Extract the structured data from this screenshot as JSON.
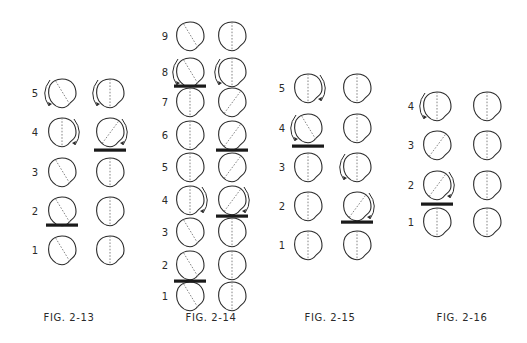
{
  "colors": {
    "ink": "#2a2a2a",
    "dash": "#777777",
    "bar": "#1a1a1a",
    "background": "#ffffff"
  },
  "figures": [
    {
      "caption": "FIG. 2-13",
      "caption_x": 69,
      "caption_y": 318,
      "label_x": 35,
      "columns_x": [
        62,
        110
      ],
      "rows": [
        {
          "label": "5",
          "y": 93,
          "cells": [
            {
              "line": "diag-left",
              "arrow": "left-ccw"
            },
            {
              "line": "vertical",
              "arrow": "left-ccw"
            }
          ]
        },
        {
          "label": "4",
          "y": 132,
          "cells": [
            {
              "line": "vertical",
              "arrow": "right-cw"
            },
            {
              "line": "diag-right",
              "arrow": "right-cw"
            }
          ]
        },
        {
          "label": "3",
          "y": 172,
          "cells": [
            {
              "line": "diag-left",
              "arrow": null
            },
            {
              "line": "vertical",
              "arrow": null
            }
          ]
        },
        {
          "label": "2",
          "y": 211,
          "cells": [
            {
              "line": "diag-left",
              "arrow": null
            },
            {
              "line": "vertical",
              "arrow": null
            }
          ]
        },
        {
          "label": "1",
          "y": 250,
          "cells": [
            {
              "line": "diag-left",
              "arrow": null
            },
            {
              "line": "vertical",
              "arrow": null
            }
          ]
        }
      ],
      "bars": [
        {
          "col": 1,
          "y": 150
        },
        {
          "col": 0,
          "y": 225
        }
      ]
    },
    {
      "caption": "FIG. 2-14",
      "caption_x": 211,
      "caption_y": 318,
      "label_x": 165,
      "columns_x": [
        190,
        232
      ],
      "rows": [
        {
          "label": "9",
          "y": 36,
          "cells": [
            {
              "line": "diag-left",
              "arrow": null
            },
            {
              "line": "vertical",
              "arrow": null
            }
          ]
        },
        {
          "label": "8",
          "y": 72,
          "cells": [
            {
              "line": "diag-left",
              "arrow": "left-ccw"
            },
            {
              "line": "vertical",
              "arrow": "left-ccw"
            }
          ]
        },
        {
          "label": "7",
          "y": 102,
          "cells": [
            {
              "line": "vertical",
              "arrow": null
            },
            {
              "line": "diag-right",
              "arrow": null
            }
          ]
        },
        {
          "label": "6",
          "y": 135,
          "cells": [
            {
              "line": "vertical",
              "arrow": null
            },
            {
              "line": "diag-right",
              "arrow": null
            }
          ]
        },
        {
          "label": "5",
          "y": 167,
          "cells": [
            {
              "line": "vertical",
              "arrow": null
            },
            {
              "line": "diag-right",
              "arrow": null
            }
          ]
        },
        {
          "label": "4",
          "y": 200,
          "cells": [
            {
              "line": "vertical",
              "arrow": "right-cw"
            },
            {
              "line": "diag-right",
              "arrow": "right-cw"
            }
          ]
        },
        {
          "label": "3",
          "y": 232,
          "cells": [
            {
              "line": "diag-left",
              "arrow": null
            },
            {
              "line": "vertical",
              "arrow": null
            }
          ]
        },
        {
          "label": "2",
          "y": 265,
          "cells": [
            {
              "line": "diag-left",
              "arrow": null
            },
            {
              "line": "vertical",
              "arrow": null
            }
          ]
        },
        {
          "label": "1",
          "y": 296,
          "cells": [
            {
              "line": "diag-left",
              "arrow": null
            },
            {
              "line": "vertical",
              "arrow": null
            }
          ]
        }
      ],
      "bars": [
        {
          "col": 0,
          "y": 86
        },
        {
          "col": 1,
          "y": 150
        },
        {
          "col": 1,
          "y": 216
        },
        {
          "col": 0,
          "y": 281
        }
      ]
    },
    {
      "caption": "FIG. 2-15",
      "caption_x": 330,
      "caption_y": 318,
      "label_x": 282,
      "columns_x": [
        308,
        357
      ],
      "rows": [
        {
          "label": "5",
          "y": 88,
          "cells": [
            {
              "line": "vertical",
              "arrow": "right-cw"
            },
            {
              "line": "vertical",
              "arrow": null
            }
          ]
        },
        {
          "label": "4",
          "y": 128,
          "cells": [
            {
              "line": "diag-left",
              "arrow": "left-ccw"
            },
            {
              "line": "vertical",
              "arrow": null
            }
          ]
        },
        {
          "label": "3",
          "y": 167,
          "cells": [
            {
              "line": "vertical",
              "arrow": null
            },
            {
              "line": "vertical",
              "arrow": "left-ccw"
            }
          ]
        },
        {
          "label": "2",
          "y": 206,
          "cells": [
            {
              "line": "vertical",
              "arrow": null
            },
            {
              "line": "diag-right",
              "arrow": "right-cw"
            }
          ]
        },
        {
          "label": "1",
          "y": 245,
          "cells": [
            {
              "line": "vertical",
              "arrow": null
            },
            {
              "line": "vertical",
              "arrow": null
            }
          ]
        }
      ],
      "bars": [
        {
          "col": 0,
          "y": 146
        },
        {
          "col": 1,
          "y": 222
        }
      ]
    },
    {
      "caption": "FIG. 2-16",
      "caption_x": 462,
      "caption_y": 318,
      "label_x": 411,
      "columns_x": [
        437,
        487
      ],
      "rows": [
        {
          "label": "4",
          "y": 106,
          "cells": [
            {
              "line": "vertical",
              "arrow": "left-ccw"
            },
            {
              "line": "vertical",
              "arrow": null
            }
          ]
        },
        {
          "label": "3",
          "y": 145,
          "cells": [
            {
              "line": "diag-right",
              "arrow": null
            },
            {
              "line": "vertical",
              "arrow": null
            }
          ]
        },
        {
          "label": "2",
          "y": 185,
          "cells": [
            {
              "line": "diag-right",
              "arrow": "right-cw"
            },
            {
              "line": "vertical",
              "arrow": null
            }
          ]
        },
        {
          "label": "1",
          "y": 222,
          "cells": [
            {
              "line": "vertical",
              "arrow": null
            },
            {
              "line": "vertical",
              "arrow": null
            }
          ]
        }
      ],
      "bars": [
        {
          "col": 0,
          "y": 204
        }
      ]
    }
  ]
}
